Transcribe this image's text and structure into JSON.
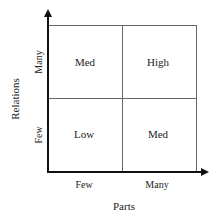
{
  "diagram": {
    "type": "2x2 matrix",
    "x_axis": {
      "title": "Parts",
      "ticks": [
        "Few",
        "Many"
      ]
    },
    "y_axis": {
      "title": "Relations",
      "ticks": [
        "Few",
        "Many"
      ]
    },
    "cells": {
      "top_left": "Med",
      "top_right": "High",
      "bottom_left": "Low",
      "bottom_right": "Med"
    },
    "colors": {
      "axis": "#111111",
      "grid": "#666666",
      "text": "#222222"
    }
  }
}
